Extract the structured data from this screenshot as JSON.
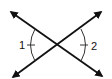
{
  "diagram": {
    "type": "vertical-angles",
    "lines": [
      {
        "name": "line-a",
        "from": [
          10,
          12
        ],
        "to": [
          103,
          76
        ],
        "arrows": "both"
      },
      {
        "name": "line-b",
        "from": [
          12,
          77
        ],
        "to": [
          102,
          11
        ],
        "arrows": "both"
      }
    ],
    "intersection": [
      59,
      45
    ],
    "angles": [
      {
        "label": "1",
        "position": "left",
        "marks": 1
      },
      {
        "label": "2",
        "position": "right",
        "marks": 1
      }
    ],
    "colors": {
      "stroke": "#111111",
      "background": "#ffffff"
    }
  }
}
